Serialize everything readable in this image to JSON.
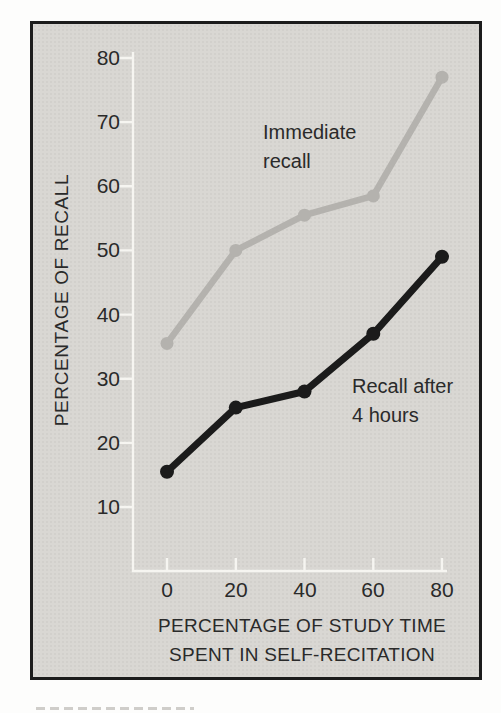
{
  "figure": {
    "outer_background": "#fdfdfc",
    "panel_background": "#d9d7d3",
    "frame_border_color": "#1c1c1c",
    "axis_color": "#f6f5f1",
    "text_color": "#2a2a2a"
  },
  "chart_data": {
    "type": "line",
    "title": "",
    "xlabel_lines": [
      "PERCENTAGE OF STUDY TIME",
      "SPENT IN SELF-RECITATION"
    ],
    "ylabel": "PERCENTAGE OF RECALL",
    "x": [
      0,
      20,
      40,
      60,
      80
    ],
    "x_ticks": [
      0,
      20,
      40,
      60,
      80
    ],
    "y_ticks": [
      10,
      20,
      30,
      40,
      50,
      60,
      70,
      80
    ],
    "xlim": [
      0,
      80
    ],
    "ylim": [
      10,
      80
    ],
    "grid": false,
    "legend_position": "inline annotations next to lines",
    "series": [
      {
        "name": "Immediate recall",
        "annotation_lines": [
          "Immediate",
          "recall"
        ],
        "color": "#b4b2ae",
        "values": [
          35.5,
          50,
          55.5,
          58.5,
          77
        ]
      },
      {
        "name": "Recall after 4 hours",
        "annotation_lines": [
          "Recall after",
          "4 hours"
        ],
        "color": "#1b1b1b",
        "values": [
          15.5,
          25.5,
          28,
          37,
          49
        ]
      }
    ]
  }
}
